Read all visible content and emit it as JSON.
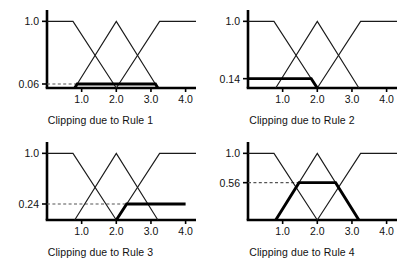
{
  "figure": {
    "panel_count": 4,
    "axis_color": "#000000",
    "curve_color": "#1a1a1a",
    "clip_color": "#000000",
    "dash_color": "#555555"
  },
  "chart_data": [
    {
      "type": "line",
      "title": "Clipping due to Rule 1",
      "xlabel": "",
      "ylabel": "",
      "xlim": [
        0.0,
        4.3
      ],
      "ylim": [
        0.0,
        1.08
      ],
      "xticks": [
        1.0,
        2.0,
        3.0,
        4.0
      ],
      "xticklabels": [
        "1.0",
        "2.0",
        "3.0",
        "4.0"
      ],
      "yticks": [
        0.06,
        1.0
      ],
      "yticklabels": [
        "0.06",
        "1.0"
      ],
      "grid": false,
      "legend": "none",
      "clip_level": 0.06,
      "clip_label": "0.06",
      "clipped_set": "middle",
      "series": [
        {
          "name": "low-shoulder",
          "x": [
            0.0,
            0.75,
            2.0
          ],
          "values": [
            1.0,
            1.0,
            0.0
          ]
        },
        {
          "name": "middle-triangle",
          "x": [
            0.8,
            2.0,
            3.2
          ],
          "values": [
            0.0,
            1.0,
            0.0
          ]
        },
        {
          "name": "high-shoulder",
          "x": [
            2.0,
            3.25,
            4.3
          ],
          "values": [
            0.0,
            1.0,
            1.0
          ]
        },
        {
          "name": "clipped-output",
          "x": [
            0.8,
            0.872,
            3.128,
            3.2
          ],
          "values": [
            0.0,
            0.06,
            0.06,
            0.0
          ]
        }
      ]
    },
    {
      "type": "line",
      "title": "Clipping due to Rule 2",
      "xlabel": "",
      "ylabel": "",
      "xlim": [
        0.0,
        4.3
      ],
      "ylim": [
        0.0,
        1.08
      ],
      "xticks": [
        1.0,
        2.0,
        3.0,
        4.0
      ],
      "xticklabels": [
        "1.0",
        "2.0",
        "3.0",
        "4.0"
      ],
      "yticks": [
        0.14,
        1.0
      ],
      "yticklabels": [
        "0.14",
        "1.0"
      ],
      "grid": false,
      "legend": "none",
      "clip_level": 0.14,
      "clip_label": "0.14",
      "clipped_set": "low-shoulder",
      "series": [
        {
          "name": "low-shoulder",
          "x": [
            0.0,
            0.75,
            2.0
          ],
          "values": [
            1.0,
            1.0,
            0.0
          ]
        },
        {
          "name": "middle-triangle",
          "x": [
            0.8,
            2.0,
            3.2
          ],
          "values": [
            0.0,
            1.0,
            0.0
          ]
        },
        {
          "name": "high-shoulder",
          "x": [
            2.0,
            3.25,
            4.3
          ],
          "values": [
            0.0,
            1.0,
            1.0
          ]
        },
        {
          "name": "clipped-output",
          "x": [
            0.0,
            1.825,
            2.0
          ],
          "values": [
            0.14,
            0.14,
            0.0
          ]
        }
      ]
    },
    {
      "type": "line",
      "title": "Clipping due to Rule 3",
      "xlabel": "",
      "ylabel": "",
      "xlim": [
        0.0,
        4.3
      ],
      "ylim": [
        0.0,
        1.08
      ],
      "xticks": [
        1.0,
        2.0,
        3.0,
        4.0
      ],
      "xticklabels": [
        "1.0",
        "2.0",
        "3.0",
        "4.0"
      ],
      "yticks": [
        0.24,
        1.0
      ],
      "yticklabels": [
        "0.24",
        "1.0"
      ],
      "grid": false,
      "legend": "none",
      "clip_level": 0.24,
      "clip_label": "0.24",
      "clipped_set": "high-shoulder",
      "series": [
        {
          "name": "low-shoulder",
          "x": [
            0.0,
            0.75,
            2.0
          ],
          "values": [
            1.0,
            1.0,
            0.0
          ]
        },
        {
          "name": "middle-triangle",
          "x": [
            0.8,
            2.0,
            3.2
          ],
          "values": [
            0.0,
            1.0,
            0.0
          ]
        },
        {
          "name": "high-shoulder",
          "x": [
            2.0,
            3.25,
            4.3
          ],
          "values": [
            0.0,
            1.0,
            1.0
          ]
        },
        {
          "name": "clipped-output",
          "x": [
            2.0,
            2.3,
            4.0
          ],
          "values": [
            0.0,
            0.24,
            0.24
          ]
        }
      ]
    },
    {
      "type": "line",
      "title": "Clipping due to Rule 4",
      "xlabel": "",
      "ylabel": "",
      "xlim": [
        0.0,
        4.3
      ],
      "ylim": [
        0.0,
        1.08
      ],
      "xticks": [
        1.0,
        2.0,
        3.0,
        4.0
      ],
      "xticklabels": [
        "1.0",
        "2.0",
        "3.0",
        "4.0"
      ],
      "yticks": [
        0.56,
        1.0
      ],
      "yticklabels": [
        "0.56",
        "1.0"
      ],
      "grid": false,
      "legend": "none",
      "clip_level": 0.56,
      "clip_label": "0.56",
      "clipped_set": "middle",
      "series": [
        {
          "name": "low-shoulder",
          "x": [
            0.0,
            0.75,
            2.0
          ],
          "values": [
            1.0,
            1.0,
            0.0
          ]
        },
        {
          "name": "middle-triangle",
          "x": [
            0.8,
            2.0,
            3.2
          ],
          "values": [
            0.0,
            1.0,
            0.0
          ]
        },
        {
          "name": "high-shoulder",
          "x": [
            2.0,
            3.25,
            4.3
          ],
          "values": [
            0.0,
            1.0,
            1.0
          ]
        },
        {
          "name": "clipped-output",
          "x": [
            0.8,
            1.472,
            2.528,
            3.2
          ],
          "values": [
            0.0,
            0.56,
            0.56,
            0.0
          ]
        }
      ]
    }
  ]
}
